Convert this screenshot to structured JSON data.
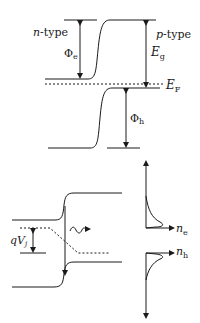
{
  "diagram": {
    "colors": {
      "line": "#1a1a1a",
      "background": "#ffffff"
    },
    "equilibrium": {
      "labels": {
        "n_type_italic": "n",
        "n_type_suffix": "-type",
        "p_type_italic": "p",
        "p_type_suffix": "-type",
        "phi_e_main": "Φ",
        "phi_e_sub": "e",
        "band_gap_main": "E",
        "band_gap_sub": "g",
        "fermi_main": "E",
        "fermi_sub": "F",
        "phi_h_main": "Φ",
        "phi_h_sub": "h"
      }
    },
    "forward_bias": {
      "labels": {
        "voltage_q": "q",
        "voltage_v": "V",
        "voltage_sub": "j",
        "electron_density_main": "n",
        "electron_density_sub": "e",
        "hole_density_main": "n",
        "hole_density_sub": "h"
      },
      "emission_symbol": "photon"
    }
  }
}
